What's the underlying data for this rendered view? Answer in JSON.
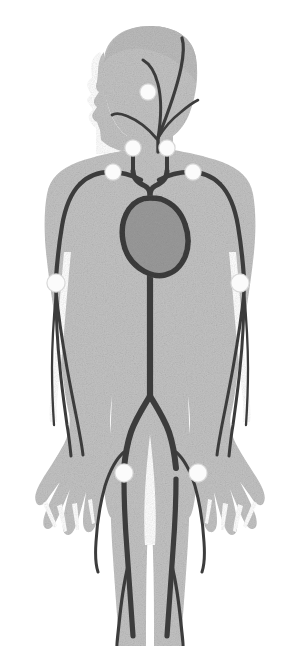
{
  "figure": {
    "view": "anterior full-body silhouette, cropped below the knees",
    "body_label": "human-body-silhouette",
    "heart_label": "heart",
    "artery_label": "artery"
  },
  "colors": {
    "background": "#ffffff",
    "body_fill": "#c3c3c3",
    "body_fill_shadow": "#bcbcbc",
    "artery_stroke": "#3c3c3c",
    "heart_fill": "#9a9a9a",
    "heart_stroke": "#3c3c3c",
    "marker_fill": "#fbfbfb",
    "marker_stroke": "#d8d8d8"
  },
  "pulse_points": [
    {
      "id": "temporal",
      "name": "Temporal pulse point",
      "side": "left",
      "cx": 148,
      "cy": 92,
      "r": 7.5
    },
    {
      "id": "carotid-left",
      "name": "Carotid pulse point (left)",
      "side": "left",
      "cx": 133,
      "cy": 148,
      "r": 7.5
    },
    {
      "id": "carotid-right",
      "name": "Carotid pulse point (right)",
      "side": "right",
      "cx": 167,
      "cy": 148,
      "r": 7.5
    },
    {
      "id": "subclavian-left",
      "name": "Subclavian pulse point (left)",
      "side": "left",
      "cx": 113,
      "cy": 172,
      "r": 7.5
    },
    {
      "id": "subclavian-right",
      "name": "Subclavian pulse point (right)",
      "side": "right",
      "cx": 193,
      "cy": 172,
      "r": 7.5
    },
    {
      "id": "brachial-left",
      "name": "Brachial pulse point (left)",
      "side": "left",
      "cx": 56,
      "cy": 283,
      "r": 8.5
    },
    {
      "id": "brachial-right",
      "name": "Brachial pulse point (right)",
      "side": "right",
      "cx": 240,
      "cy": 283,
      "r": 8.5
    },
    {
      "id": "femoral-left",
      "name": "Femoral pulse point (left)",
      "side": "left",
      "cx": 124,
      "cy": 473,
      "r": 8.5
    },
    {
      "id": "femoral-right",
      "name": "Femoral pulse point (right)",
      "side": "right",
      "cx": 198,
      "cy": 473,
      "r": 8.5
    }
  ],
  "vessels": [
    {
      "id": "superficial-temporal",
      "name": "Superficial temporal artery"
    },
    {
      "id": "occipital",
      "name": "Occipital artery"
    },
    {
      "id": "facial",
      "name": "Facial artery"
    },
    {
      "id": "common-carotid-left",
      "name": "Common carotid artery (left)"
    },
    {
      "id": "common-carotid-right",
      "name": "Common carotid artery (right)"
    },
    {
      "id": "subclavian-left",
      "name": "Subclavian artery (left)"
    },
    {
      "id": "subclavian-right",
      "name": "Subclavian artery (right)"
    },
    {
      "id": "brachial-left",
      "name": "Brachial artery (left)"
    },
    {
      "id": "brachial-right",
      "name": "Brachial artery (right)"
    },
    {
      "id": "radial-left",
      "name": "Radial artery (left)"
    },
    {
      "id": "ulnar-left",
      "name": "Ulnar artery (left)"
    },
    {
      "id": "radial-right",
      "name": "Radial artery (right)"
    },
    {
      "id": "ulnar-right",
      "name": "Ulnar artery (right)"
    },
    {
      "id": "aortic-arch",
      "name": "Aortic arch"
    },
    {
      "id": "descending-aorta",
      "name": "Descending aorta"
    },
    {
      "id": "iliac-left",
      "name": "Common iliac artery (left)"
    },
    {
      "id": "iliac-right",
      "name": "Common iliac artery (right)"
    },
    {
      "id": "femoral-left",
      "name": "Femoral artery (left)"
    },
    {
      "id": "femoral-right",
      "name": "Femoral artery (right)"
    },
    {
      "id": "popliteal-left",
      "name": "Popliteal artery (left)"
    },
    {
      "id": "popliteal-right",
      "name": "Popliteal artery (right)"
    }
  ],
  "counts": {
    "pulse_point_total": 9,
    "marker_shape": "filled-white-circle"
  }
}
